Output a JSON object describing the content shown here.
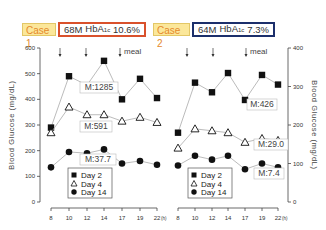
{
  "header": {
    "case1": {
      "label": "Case 1",
      "age_sex": "68M",
      "hba1c_label": "HbA",
      "hba1c_sub": "1c",
      "hba1c_value": "10.6%",
      "border_color": "#d9512c"
    },
    "case2": {
      "label": "Case 2",
      "age_sex": "64M",
      "hba1c_label": "HbA",
      "hba1c_sub": "1c",
      "hba1c_value": "7.3%",
      "border_color": "#1c2f6b"
    }
  },
  "meal_label": "meal",
  "legend": [
    "Day  2",
    "Day  4",
    "Day  14"
  ],
  "chart_data": [
    {
      "type": "line",
      "title": "Case 1 (68M, HbA1c 10.6%)",
      "xlabel": "Time (h)",
      "ylabel": "Blood Glucose (mg/dL)",
      "x": [
        8,
        10,
        12,
        14,
        17,
        19,
        22
      ],
      "x_unit": "(h)",
      "ylim": [
        0,
        600
      ],
      "yticks": [
        0,
        100,
        200,
        300,
        400,
        500,
        600
      ],
      "meal_times": [
        9,
        12,
        18
      ],
      "series": [
        {
          "name": "Day 2",
          "marker": "filled-square",
          "values": [
            290,
            490,
            455,
            550,
            400,
            480,
            405
          ],
          "annotation": "M:1285"
        },
        {
          "name": "Day 4",
          "marker": "open-triangle",
          "values": [
            270,
            370,
            340,
            340,
            315,
            330,
            310
          ],
          "annotation": "M:591"
        },
        {
          "name": "Day 14",
          "marker": "filled-circle",
          "values": [
            135,
            195,
            190,
            205,
            150,
            160,
            145
          ],
          "annotation": "M:37.7"
        }
      ],
      "legend_position": "bottom-center",
      "grid": false
    },
    {
      "type": "line",
      "title": "Case 2 (64M, HbA1c 7.3%)",
      "xlabel": "Time (h)",
      "ylabel": "Blood Glucose (mg/dL)",
      "x": [
        8,
        10,
        12,
        14,
        17,
        19,
        22
      ],
      "x_unit": "(h)",
      "ylim": [
        0,
        400
      ],
      "yticks": [
        0,
        100,
        200,
        300,
        400
      ],
      "meal_times": [
        9,
        12,
        18
      ],
      "series": [
        {
          "name": "Day 2",
          "marker": "filled-square",
          "values": [
            180,
            310,
            285,
            335,
            265,
            330,
            305
          ],
          "annotation": "M:426"
        },
        {
          "name": "Day 4",
          "marker": "open-triangle",
          "values": [
            140,
            190,
            185,
            180,
            155,
            165,
            160
          ],
          "annotation": "M:29.0"
        },
        {
          "name": "Day 14",
          "marker": "filled-circle",
          "values": [
            95,
            120,
            110,
            120,
            85,
            100,
            90
          ],
          "annotation": "M:7.4"
        }
      ],
      "legend_position": "bottom-left",
      "grid": false
    }
  ]
}
